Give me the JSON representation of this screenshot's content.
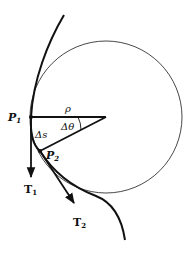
{
  "diagram": {
    "colors": {
      "stroke": "#111111",
      "circle": "#333333",
      "background": "#ffffff"
    },
    "labels": {
      "p1": {
        "main": "P",
        "sub": "1"
      },
      "p2": {
        "main": "P",
        "sub": "2"
      },
      "rho": "ρ",
      "delta_theta": "Δθ",
      "delta_s": "Δs",
      "t1": {
        "main": "T",
        "sub": "1"
      },
      "t2": {
        "main": "T",
        "sub": "2"
      }
    }
  }
}
